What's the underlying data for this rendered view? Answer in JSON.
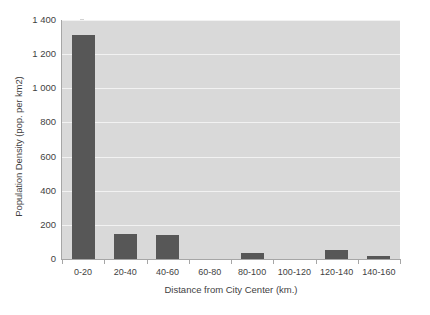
{
  "chart_data": {
    "type": "bar",
    "title": "",
    "xlabel": "Distance from City Center (km.)",
    "ylabel": "Population Density (pop. per km2)",
    "categories": [
      "0-20",
      "20-40",
      "40-60",
      "60-80",
      "80-100",
      "100-120",
      "120-140",
      "140-160"
    ],
    "values": [
      1315,
      145,
      140,
      0,
      35,
      0,
      50,
      15
    ],
    "series": [
      {
        "name": "Population Density",
        "values": [
          1315,
          145,
          140,
          0,
          35,
          0,
          50,
          15
        ]
      }
    ],
    "ylim": [
      0,
      1400
    ],
    "ytick_values": [
      0,
      200,
      400,
      600,
      800,
      1000,
      1200,
      1400
    ],
    "ytick_labels": [
      "0",
      "200",
      "400",
      "600",
      "800",
      "1 000",
      "1 200",
      "1 400"
    ],
    "grid": true,
    "legend": false,
    "legend_position": "none",
    "colors": {
      "bar": "#575757",
      "plot_background": "#d9d9d9",
      "gridline": "#f2f2f2",
      "axis": "#a6a6a6",
      "text": "#3f3f3f",
      "figure_background": "#ffffff"
    }
  }
}
